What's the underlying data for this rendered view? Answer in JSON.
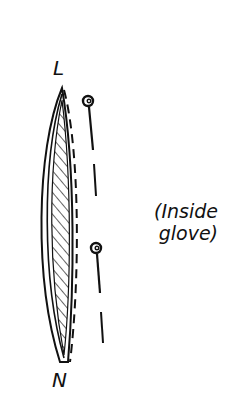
{
  "diagram": {
    "labels": {
      "top": "L",
      "bottom": "N"
    },
    "note": {
      "line1": "(Inside",
      "line2": "glove)"
    },
    "colors": {
      "ink": "#111111",
      "background": "#ffffff"
    },
    "elements": {
      "blade": "hatched lens-shaped lining piece",
      "seam": "dashed stitching line",
      "pins": 2,
      "pin_line": "dashed placement line"
    }
  }
}
